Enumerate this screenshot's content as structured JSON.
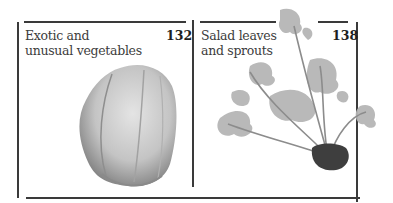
{
  "panels": [
    {
      "title_line1": "Exotic and",
      "title_line2": "unusual vegetables",
      "page": "132",
      "image": "chayote-icon"
    },
    {
      "title_line1": "Salad leaves",
      "title_line2": "and sprouts",
      "page": "138",
      "image": "salad-leaves-icon"
    }
  ],
  "colors": {
    "rule": "#3a3a3a",
    "text": "#3c3c3c",
    "number": "#1e1e1e"
  }
}
